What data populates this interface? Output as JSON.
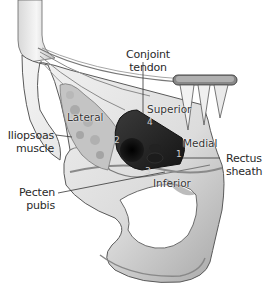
{
  "figure": {
    "colors": {
      "bone": "#e6e6e6",
      "bone_shadow": "#9a9a9a",
      "outline": "#555555",
      "triangle": "#2b2b2b",
      "triangle_dark": "#0d0d0d",
      "muscle": "#bcbcbc",
      "label_text": "#2a2a2a"
    }
  },
  "labels": {
    "conjoint_tendon": "Conjoint tendon",
    "iliopsoas_line1": "Iliopsoas",
    "iliopsoas_line2": "muscle",
    "pecten_line1": "Pecten",
    "pecten_line2": "pubis",
    "rectus_line1": "Rectus",
    "rectus_line2": "sheath"
  },
  "boundaries": {
    "superior": "Superior",
    "lateral": "Lateral",
    "medial": "Medial",
    "inferior": "Inferior"
  },
  "numbers": {
    "n1": "1",
    "n2": "2",
    "n3": "3",
    "n4": "4"
  }
}
